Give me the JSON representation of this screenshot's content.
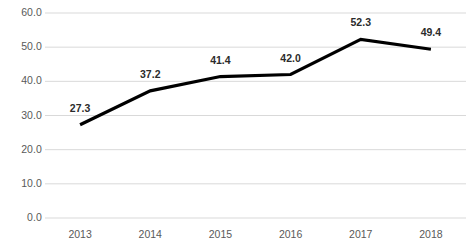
{
  "chart_data": {
    "type": "line",
    "title": "",
    "subtitle": "",
    "xlabel": "",
    "ylabel": "",
    "categories": [
      "2013",
      "2014",
      "2015",
      "2016",
      "2017",
      "2018"
    ],
    "values": [
      27.3,
      37.2,
      41.4,
      42.0,
      52.3,
      49.4
    ],
    "point_labels": [
      "27.3",
      "37.2",
      "41.4",
      "42.0",
      "52.3",
      "49.4"
    ],
    "ylim": [
      0,
      60
    ],
    "y_ticks": [
      0,
      10,
      20,
      30,
      40,
      50,
      60
    ],
    "y_tick_labels": [
      "0.0",
      "10.0",
      "20.0",
      "30.0",
      "40.0",
      "50.0",
      "60.0"
    ],
    "grid": true,
    "grid_axis": "y",
    "legend": false,
    "legend_position": "none",
    "series": [
      {
        "name": "",
        "values": [
          27.3,
          37.2,
          41.4,
          42.0,
          52.3,
          49.4
        ]
      }
    ],
    "colors": {
      "line": "#000000",
      "gridline": "#d9d9d9",
      "axis_text": "#595959",
      "label_text": "#2b2b2b",
      "background": "#ffffff"
    },
    "line_width": 3.2,
    "markers": false
  }
}
